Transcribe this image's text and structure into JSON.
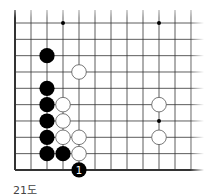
{
  "diagram": {
    "caption": "21도",
    "grid": {
      "x0": 15,
      "y0": 23,
      "spacing_x": 16,
      "spacing_y": 16.33,
      "cols": 12,
      "rows": 10,
      "left_edge": true,
      "bottom_edge": true,
      "top_edge": false,
      "right_edge": false
    },
    "star_points": [
      [
        3,
        0
      ],
      [
        9,
        0
      ],
      [
        9,
        6
      ]
    ],
    "stones": [
      {
        "col": 2,
        "row": 2,
        "color": "black"
      },
      {
        "col": 4,
        "row": 3,
        "color": "white"
      },
      {
        "col": 2,
        "row": 4,
        "color": "black"
      },
      {
        "col": 2,
        "row": 5,
        "color": "black"
      },
      {
        "col": 3,
        "row": 5,
        "color": "white"
      },
      {
        "col": 9,
        "row": 5,
        "color": "white"
      },
      {
        "col": 2,
        "row": 6,
        "color": "black"
      },
      {
        "col": 3,
        "row": 6,
        "color": "white"
      },
      {
        "col": 2,
        "row": 7,
        "color": "black"
      },
      {
        "col": 3,
        "row": 7,
        "color": "white"
      },
      {
        "col": 4,
        "row": 7,
        "color": "white"
      },
      {
        "col": 9,
        "row": 7,
        "color": "white"
      },
      {
        "col": 2,
        "row": 8,
        "color": "black"
      },
      {
        "col": 3,
        "row": 8,
        "color": "black"
      },
      {
        "col": 4,
        "row": 8,
        "color": "white"
      },
      {
        "col": 4,
        "row": 9,
        "color": "black",
        "label": "1"
      }
    ],
    "colors": {
      "line": "#333333",
      "black_stone": "#000000",
      "white_stone": "#ffffff",
      "white_stroke": "#555555",
      "label_on_black": "#ffffff"
    }
  }
}
